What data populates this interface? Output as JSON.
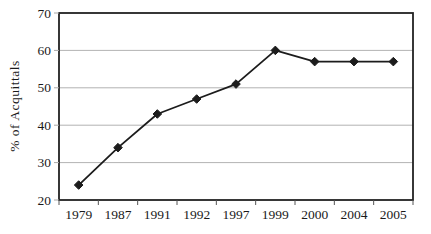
{
  "chart_data": {
    "type": "line",
    "categories": [
      "1979",
      "1987",
      "1991",
      "1992",
      "1997",
      "1999",
      "2000",
      "2004",
      "2005"
    ],
    "series": [
      {
        "name": "% of Acquittals",
        "values": [
          24,
          34,
          43,
          47,
          51,
          60,
          57,
          57,
          57
        ]
      }
    ],
    "title": "",
    "xlabel": "",
    "ylabel": "% of Acquittals",
    "ylim": [
      20,
      70
    ],
    "ytick_step": 10,
    "ytick_labels": [
      "20",
      "30",
      "40",
      "50",
      "60",
      "70"
    ],
    "grid": "horizontal",
    "legend": "none",
    "marker": "diamond",
    "colors": {
      "line": "#1c1c1c",
      "marker": "#1c1c1c",
      "grid": "#b3b3b3",
      "axis_box": "#222222",
      "x_tick": "#555555",
      "y_tick": "#a8a8a8",
      "text": "#1a1a1a",
      "background": "#ffffff"
    }
  }
}
